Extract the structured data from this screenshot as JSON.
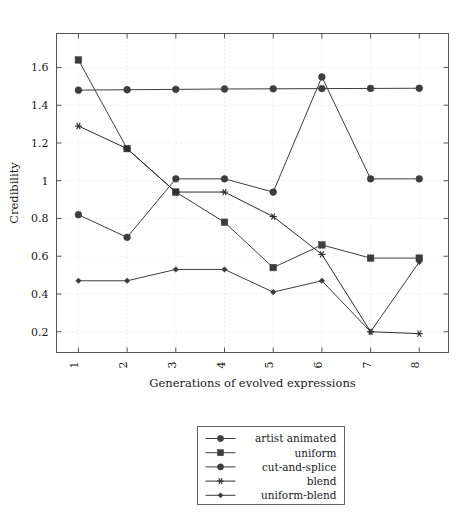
{
  "chart_data": {
    "type": "line",
    "title": "",
    "xlabel": "Generations of evolved expressions",
    "ylabel": "Credibility",
    "categories": [
      "1",
      "2",
      "3",
      "4",
      "5",
      "6",
      "7",
      "8"
    ],
    "x": [
      1,
      2,
      3,
      4,
      5,
      6,
      7,
      8
    ],
    "xlim": [
      0.55,
      8.6
    ],
    "ylim": [
      0.09,
      1.78
    ],
    "yticks": [
      "0.2",
      "0.4",
      "0.6",
      "0.8",
      "1",
      "1.2",
      "1.4",
      "1.6"
    ],
    "ytick_values": [
      0.2,
      0.4,
      0.6,
      0.8,
      1.0,
      1.2,
      1.4,
      1.6
    ],
    "grid": true,
    "legend_position": "below-plot-center",
    "series": [
      {
        "name": "artist animated",
        "marker": "circle",
        "color": "#3d3d3d",
        "values": [
          1.48,
          1.482,
          1.484,
          1.486,
          1.487,
          1.488,
          1.489,
          1.49
        ]
      },
      {
        "name": "uniform",
        "marker": "square",
        "color": "#3d3d3d",
        "values": [
          1.64,
          1.17,
          0.94,
          0.78,
          0.54,
          0.66,
          0.59,
          0.59
        ]
      },
      {
        "name": "cut-and-splice",
        "marker": "circle",
        "color": "#3d3d3d",
        "values": [
          0.82,
          0.7,
          1.01,
          1.01,
          0.94,
          1.55,
          1.01,
          1.01
        ]
      },
      {
        "name": "blend",
        "marker": "star",
        "color": "#2b2b2b",
        "values": [
          1.29,
          1.17,
          0.94,
          0.94,
          0.81,
          0.61,
          0.2,
          0.19
        ]
      },
      {
        "name": "uniform-blend",
        "marker": "diamond",
        "color": "#3d3d3d",
        "values": [
          0.47,
          0.47,
          0.53,
          0.53,
          0.41,
          0.47,
          0.2,
          0.57
        ]
      }
    ]
  }
}
